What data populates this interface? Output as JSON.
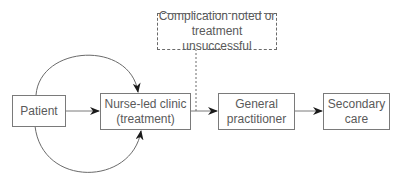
{
  "diagram": {
    "type": "flowchart",
    "nodes": {
      "patient": {
        "lines": [
          "Patient"
        ]
      },
      "nurse_clinic": {
        "lines": [
          "Nurse-led clinic",
          "(treatment)"
        ]
      },
      "gp": {
        "lines": [
          "General",
          "practitioner"
        ]
      },
      "secondary": {
        "lines": [
          "Secondary",
          "care"
        ]
      },
      "complication": {
        "lines": [
          "Complication noted or",
          "treatment unsuccessful"
        ]
      }
    },
    "edges": [
      {
        "from": "patient",
        "to": "nurse_clinic",
        "style": "solid",
        "arrow": true
      },
      {
        "from": "patient",
        "to": "nurse_clinic",
        "style": "curved-top",
        "arrow": true
      },
      {
        "from": "patient",
        "to": "nurse_clinic",
        "style": "curved-bottom",
        "arrow": true
      },
      {
        "from": "nurse_clinic",
        "to": "gp",
        "style": "solid",
        "arrow": true
      },
      {
        "from": "gp",
        "to": "secondary",
        "style": "solid",
        "arrow": true
      },
      {
        "from": "complication",
        "to": "nurse_clinic-gp-edge",
        "style": "dashed",
        "arrow": false
      }
    ],
    "colors": {
      "stroke": "#7a7a7a",
      "text": "#5a5a5a",
      "arrowhead": "#1a1a1a"
    }
  }
}
